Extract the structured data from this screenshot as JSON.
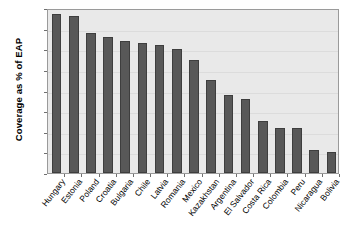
{
  "chart_data": {
    "type": "bar",
    "title": "",
    "xlabel": "",
    "ylabel": "Coverage as % of EAP",
    "ylim": [
      0,
      80
    ],
    "ytick_step": 10,
    "yticks": [
      0,
      10,
      20,
      30,
      40,
      50,
      60,
      70,
      80
    ],
    "grid": true,
    "legend": "none",
    "categories": [
      "Hungary",
      "Estonia",
      "Poland",
      "Croatia",
      "Bulgaria",
      "Chile",
      "Latvia",
      "Romania",
      "Mexico",
      "Kazakhstan",
      "Argentina",
      "El Salvador",
      "Costa Rica",
      "Colombia",
      "Peru",
      "Nicaragua",
      "Bolivia"
    ],
    "values": [
      77,
      76,
      68,
      66,
      64,
      63,
      62,
      60,
      55,
      45,
      38,
      36,
      25,
      22,
      22,
      11,
      10
    ],
    "bar_color": "#585858",
    "bar_edge_color": "#3e3e3e",
    "plot_background": "#e9e9e9",
    "frame_color": "#9a9a9a",
    "gridline_color": "#dcdcdc"
  }
}
